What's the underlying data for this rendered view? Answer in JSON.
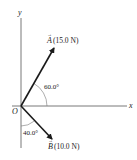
{
  "diagram": {
    "type": "vector-diagram",
    "axes": {
      "x_label": "x",
      "y_label": "y",
      "origin_label": "O"
    },
    "vectors": [
      {
        "name": "A",
        "label_symbol": "A",
        "magnitude_text": "(15.0 N)",
        "angle_text": "60.0°",
        "angle_reference": "from +x axis",
        "color": "#1a1a1a"
      },
      {
        "name": "B",
        "label_symbol": "B",
        "magnitude_text": "(10.0 N)",
        "angle_text": "40.0°",
        "angle_reference": "from -y axis",
        "color": "#1a1a1a"
      }
    ],
    "colors": {
      "axis": "#555555",
      "vector": "#1a1a1a",
      "arc": "#777777",
      "text": "#222222"
    }
  }
}
